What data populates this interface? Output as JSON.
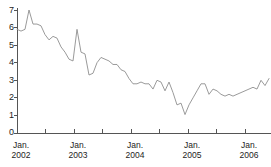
{
  "chart_data": {
    "type": "line",
    "title": "",
    "xlabel": "",
    "ylabel": "",
    "ylim": [
      0,
      7
    ],
    "xlim": [
      "2002-01",
      "2006-07"
    ],
    "grid": false,
    "legend_position": "none",
    "y_ticks": [
      "0",
      "1",
      "2",
      "3",
      "4",
      "5",
      "6",
      "7"
    ],
    "y_tick_values": [
      0,
      1,
      2,
      3,
      4,
      5,
      6,
      7
    ],
    "x_tick_labels": [
      {
        "month": "Jan.",
        "year": "2002"
      },
      {
        "month": "Jan.",
        "year": "2003"
      },
      {
        "month": "Jan.",
        "year": "2004"
      },
      {
        "month": "Jan.",
        "year": "2005"
      },
      {
        "month": "Jan.",
        "year": "2006"
      }
    ],
    "x_minor_tick_count": 9,
    "x_tick_interval_months": 6,
    "line_color": "#8f8f8f",
    "axis_color": "#555555",
    "series": [
      {
        "name": "value",
        "x": [
          "2002-01",
          "2002-02",
          "2002-03",
          "2002-04",
          "2002-05",
          "2002-06",
          "2002-07",
          "2002-08",
          "2002-09",
          "2002-10",
          "2002-11",
          "2002-12",
          "2003-01",
          "2003-02",
          "2003-03",
          "2003-04",
          "2003-05",
          "2003-06",
          "2003-07",
          "2003-08",
          "2003-09",
          "2003-10",
          "2003-11",
          "2003-12",
          "2004-01",
          "2004-02",
          "2004-03",
          "2004-04",
          "2004-05",
          "2004-06",
          "2004-07",
          "2004-08",
          "2004-09",
          "2004-10",
          "2004-11",
          "2004-12",
          "2005-01",
          "2005-02",
          "2005-03",
          "2005-04",
          "2005-05",
          "2005-06",
          "2005-07",
          "2005-08",
          "2005-09",
          "2005-10",
          "2005-11",
          "2005-12",
          "2006-01",
          "2006-02",
          "2006-03",
          "2006-04",
          "2006-05",
          "2006-06"
        ],
        "values": [
          5.9,
          5.8,
          5.9,
          7.0,
          6.2,
          6.2,
          6.1,
          5.6,
          5.3,
          5.5,
          5.4,
          4.9,
          4.6,
          4.2,
          4.1,
          5.9,
          4.6,
          4.5,
          3.3,
          3.4,
          4.0,
          4.3,
          4.2,
          4.1,
          3.9,
          3.9,
          3.6,
          3.5,
          3.1,
          2.8,
          2.8,
          2.9,
          2.8,
          2.8,
          2.5,
          3.0,
          2.9,
          2.4,
          2.9,
          2.3,
          1.6,
          1.7,
          1.05,
          1.6,
          2.0,
          2.4,
          2.8,
          2.8,
          2.2,
          2.5,
          2.4,
          2.2,
          2.1,
          2.2
        ]
      }
    ],
    "series_extra_values": [
      2.1,
      2.2,
      2.3,
      2.4,
      2.5,
      2.6,
      2.5,
      3.0,
      2.7,
      3.1
    ],
    "peak": {
      "label": "7.0",
      "x": "2002-04"
    },
    "trough": {
      "label": "1.05",
      "x": "2004-10"
    },
    "start_value": 5.9,
    "end_value": 3.1
  }
}
